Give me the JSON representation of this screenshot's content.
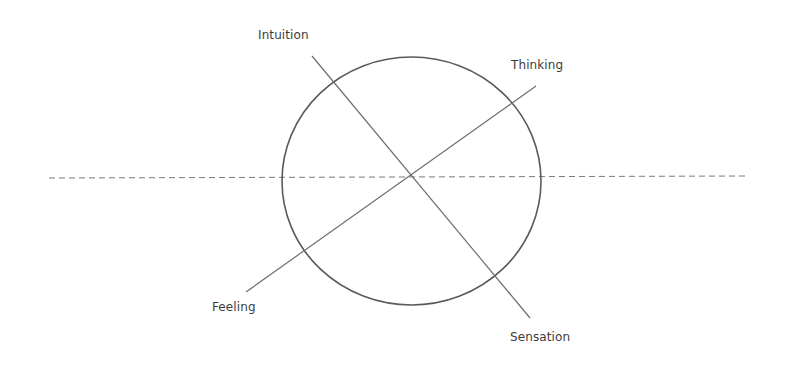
{
  "diagram": {
    "title": "",
    "colors": {
      "stroke": "#6e6e6e",
      "circle_stroke": "#5a5a5a",
      "dashed": "#7a7a7a",
      "text": "#3c3c3c"
    },
    "circle": {
      "cx": 411.5,
      "cy": 181,
      "rx": 129.5,
      "ry": 124
    },
    "horizon": {
      "x1": 49,
      "y1": 178,
      "x2": 748,
      "y2": 176,
      "style": "dashed"
    },
    "axes": [
      {
        "name": "intuition-sensation",
        "x1": 312,
        "y1": 56,
        "x2": 530,
        "y2": 318
      },
      {
        "name": "thinking-feeling",
        "x1": 536,
        "y1": 86,
        "x2": 246,
        "y2": 292
      }
    ],
    "labels": {
      "intuition": {
        "text": "Intuition",
        "x": 258,
        "y": 28
      },
      "thinking": {
        "text": "Thinking",
        "x": 511,
        "y": 58
      },
      "feeling": {
        "text": "Feeling",
        "x": 212,
        "y": 300
      },
      "sensation": {
        "text": "Sensation",
        "x": 510,
        "y": 330
      }
    }
  }
}
